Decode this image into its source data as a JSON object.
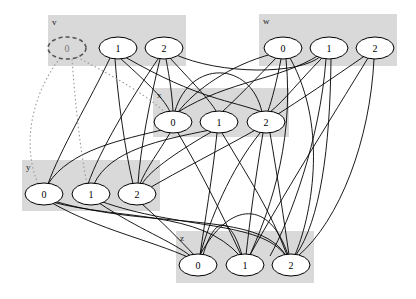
{
  "diagram": {
    "type": "clustered-graph",
    "colors": {
      "cluster_fill": "#d9d9d9",
      "node_fill": "#ffffff",
      "edge": "#000000",
      "dotted_edge": "#999999"
    },
    "clusters": [
      {
        "id": "v",
        "label": "v",
        "x": 48,
        "y": 15,
        "w": 138,
        "h": 51
      },
      {
        "id": "w",
        "label": "w",
        "x": 259,
        "y": 14,
        "w": 138,
        "h": 52
      },
      {
        "id": "x",
        "label": "x",
        "x": 153,
        "y": 88,
        "w": 136,
        "h": 49
      },
      {
        "id": "y",
        "label": "y",
        "x": 22,
        "y": 160,
        "w": 138,
        "h": 51
      },
      {
        "id": "z",
        "label": "z",
        "x": 176,
        "y": 231,
        "w": 138,
        "h": 52
      }
    ],
    "nodes": [
      {
        "id": "v0",
        "label": "0",
        "cluster": "v",
        "cx": 67,
        "cy": 48,
        "style": "dashed"
      },
      {
        "id": "v1",
        "label": "1",
        "cluster": "v",
        "cx": 118,
        "cy": 48
      },
      {
        "id": "v2",
        "label": "2",
        "cluster": "v",
        "cx": 164,
        "cy": 48
      },
      {
        "id": "w0",
        "label": "0",
        "cluster": "w",
        "cx": 283,
        "cy": 48
      },
      {
        "id": "w1",
        "label": "1",
        "cluster": "w",
        "cx": 329,
        "cy": 48
      },
      {
        "id": "w2",
        "label": "2",
        "cluster": "w",
        "cx": 375,
        "cy": 48
      },
      {
        "id": "x0",
        "label": "0",
        "cluster": "x",
        "cx": 173,
        "cy": 122
      },
      {
        "id": "x1",
        "label": "1",
        "cluster": "x",
        "cx": 219,
        "cy": 122
      },
      {
        "id": "x2",
        "label": "2",
        "cluster": "x",
        "cx": 266,
        "cy": 122
      },
      {
        "id": "y0",
        "label": "0",
        "cluster": "y",
        "cx": 44,
        "cy": 194
      },
      {
        "id": "y1",
        "label": "1",
        "cluster": "y",
        "cx": 91,
        "cy": 194
      },
      {
        "id": "y2",
        "label": "2",
        "cluster": "y",
        "cx": 137,
        "cy": 194
      },
      {
        "id": "z0",
        "label": "0",
        "cluster": "z",
        "cx": 198,
        "cy": 265
      },
      {
        "id": "z1",
        "label": "1",
        "cluster": "z",
        "cx": 245,
        "cy": 265
      },
      {
        "id": "z2",
        "label": "2",
        "cluster": "z",
        "cx": 291,
        "cy": 265
      }
    ],
    "edges": [
      {
        "d": "M110,58 C90,100 60,150 48,184"
      },
      {
        "d": "M115,59 C118,100 125,150 133,184"
      },
      {
        "d": "M121,59 C150,85 165,100 170,112"
      },
      {
        "d": "M125,57 C200,100 230,100 262,112"
      },
      {
        "d": "M158,59 C130,100 100,150 88,184"
      },
      {
        "d": "M160,59 C150,100 140,150 138,184"
      },
      {
        "d": "M166,59 C170,80 172,95 173,111"
      },
      {
        "d": "M170,58 C190,80 210,100 216,111"
      },
      {
        "d": "M174,54 C220,75 300,75 321,56"
      },
      {
        "d": "M272,54 C230,65 195,90 178,112"
      },
      {
        "d": "M276,58 C255,80 235,100 222,112"
      },
      {
        "d": "M281,59 C277,80 272,100 268,111"
      },
      {
        "d": "M286,59 C295,150 265,220 250,255"
      },
      {
        "d": "M290,58 C330,130 310,220 295,255"
      },
      {
        "d": "M319,55 C280,80 230,80 178,112"
      },
      {
        "d": "M322,58 C300,80 285,100 270,112"
      },
      {
        "d": "M326,59 C320,140 290,220 270,256"
      },
      {
        "d": "M331,59 C330,150 320,220 296,255"
      },
      {
        "d": "M366,55 C330,80 300,100 275,116"
      },
      {
        "d": "M368,58 C330,120 280,200 250,255"
      },
      {
        "d": "M374,59 C370,140 340,220 298,256"
      },
      {
        "d": "M166,129 C120,140 70,150 48,184"
      },
      {
        "d": "M170,133 C160,150 145,170 140,184"
      },
      {
        "d": "M178,133 C200,170 220,210 241,255"
      },
      {
        "d": "M210,130 C160,140 110,150 94,184"
      },
      {
        "d": "M213,131 C180,150 150,170 142,184"
      },
      {
        "d": "M217,133 C212,180 205,220 200,255"
      },
      {
        "d": "M222,133 C250,180 270,210 287,255"
      },
      {
        "d": "M260,133 C230,170 210,220 200,255"
      },
      {
        "d": "M263,133 C255,180 250,220 246,255"
      },
      {
        "d": "M270,133 C278,180 284,220 289,255"
      },
      {
        "d": "M259,128 C220,150 180,170 146,190"
      },
      {
        "d": "M175,111 C190,60 250,60 262,112"
      },
      {
        "d": "M52,203 C100,230 150,240 190,258"
      },
      {
        "d": "M52,202 C120,220 200,210 240,256"
      },
      {
        "d": "M54,201 C150,230 260,210 286,256"
      },
      {
        "d": "M99,203 C140,230 170,240 192,257"
      },
      {
        "d": "M100,201 C180,230 260,220 286,256"
      },
      {
        "d": "M142,204 C160,220 180,240 195,256"
      },
      {
        "d": "M203,255 C215,215 230,215 242,255"
      },
      {
        "d": "M200,255 C230,200 270,200 288,255"
      }
    ],
    "dotted_edges": [
      {
        "d": "M60,58 C35,90 20,140 38,184"
      },
      {
        "d": "M72,59 C75,100 80,150 87,184"
      },
      {
        "d": "M77,57 C110,75 140,90 166,113"
      }
    ]
  }
}
